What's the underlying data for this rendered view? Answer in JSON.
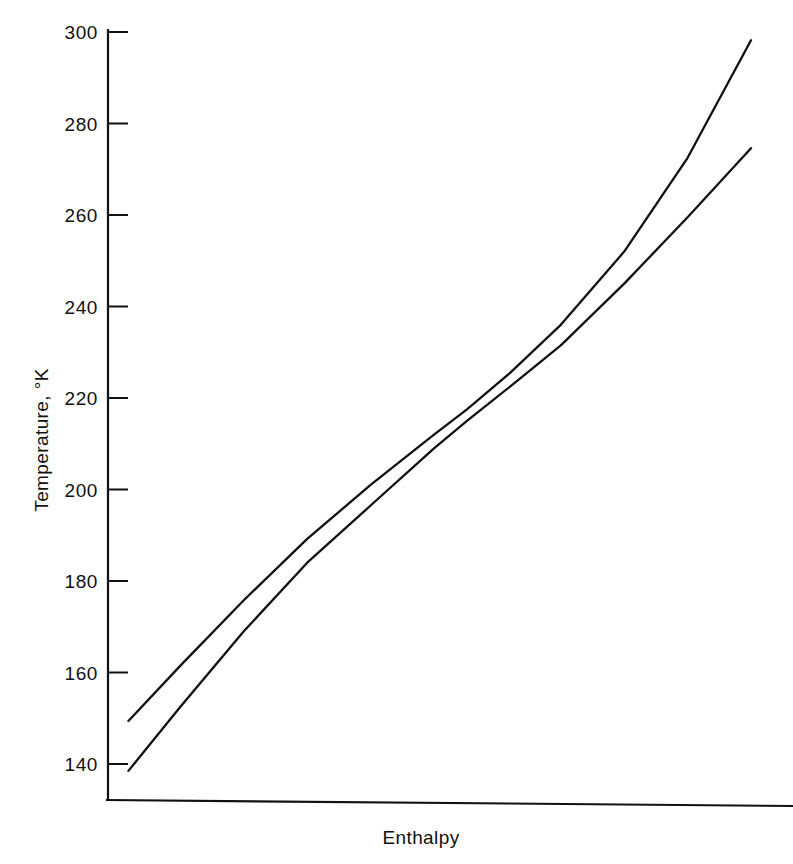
{
  "chart_data": {
    "type": "line",
    "title": "",
    "xlabel": "Enthalpy",
    "ylabel": "Temperature, °K",
    "grid": false,
    "legend": "none",
    "ylim": [
      130,
      300
    ],
    "yticks": [
      140,
      160,
      180,
      200,
      220,
      240,
      260,
      280,
      300
    ],
    "ytick_labels": [
      "140",
      "160",
      "180",
      "200",
      "220",
      "240",
      "260",
      "280",
      "300"
    ],
    "xlim": [
      0,
      100
    ],
    "xticks": [],
    "xtick_labels": [],
    "series": [
      {
        "name": "upper-curve",
        "color": "#111111",
        "x": [
          1.8,
          10.0,
          20.0,
          30.0,
          40.0,
          50.0,
          55.2,
          62.0,
          70.0,
          80.0,
          90.0,
          100.0
        ],
        "values": [
          149.4,
          161.5,
          175.8,
          189.2,
          201.0,
          212.0,
          217.5,
          225.5,
          236.0,
          252.0,
          272.5,
          298.2
        ]
      },
      {
        "name": "lower-curve",
        "color": "#111111",
        "x": [
          1.8,
          10.0,
          20.0,
          30.0,
          40.0,
          50.0,
          55.2,
          62.0,
          70.0,
          80.0,
          90.0,
          100.0
        ],
        "values": [
          138.5,
          152.5,
          169.0,
          184.0,
          196.5,
          209.0,
          215.0,
          222.5,
          231.5,
          245.0,
          259.5,
          274.6
        ]
      }
    ],
    "annotations": []
  },
  "axes": {
    "y_axis_name": "temperature-axis",
    "x_axis_name": "enthalpy-axis"
  }
}
